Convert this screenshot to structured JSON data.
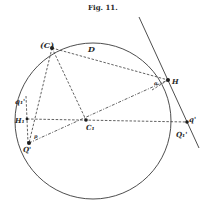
{
  "figure": {
    "title": "Fig. 11.",
    "labels": {
      "C": "(C)",
      "D": "D",
      "H": "H",
      "q_prime": "q'",
      "Q1_prime": "Q₁'",
      "C1": "C₁",
      "H1": "H₁",
      "q1": "q₁'",
      "Q_prime": "Q'",
      "p": "p",
      "alpha": "α"
    },
    "colors": {
      "ink": "#2a2a2a",
      "background": "#ffffff"
    }
  }
}
